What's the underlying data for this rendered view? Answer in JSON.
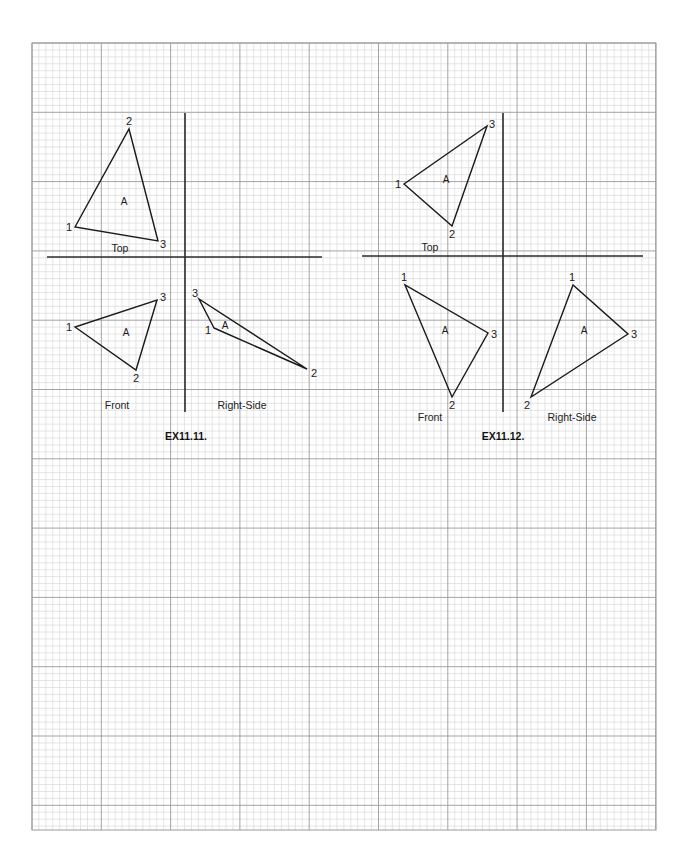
{
  "page": {
    "width": 691,
    "height": 868,
    "background": "#ffffff"
  },
  "grid": {
    "x0": 32,
    "y0": 43,
    "x1": 656,
    "y1": 830,
    "minor_step": 6.93,
    "major_every": 10,
    "minor_color": "#d4d4d4",
    "major_color": "#9a9a9a",
    "border_color": "#9a9a9a"
  },
  "colors": {
    "line": "#1a1a1a",
    "axis": "#2a2a2a",
    "text": "#1a1a1a"
  },
  "exercises": [
    {
      "id": "EX11.11.",
      "caption": {
        "text": "EX11.11.",
        "x": 186,
        "y": 436
      },
      "axes": {
        "horizontal": {
          "x1": 47,
          "y": 257,
          "x2": 322
        },
        "vertical": {
          "x": 185,
          "y1": 113,
          "y2": 412
        }
      },
      "views": [
        {
          "name": "Top",
          "label": {
            "text": "Top",
            "x": 120,
            "y": 248
          },
          "face_label": {
            "text": "A",
            "x": 124,
            "y": 202
          },
          "points": [
            {
              "n": "1",
              "x": 75,
              "y": 227,
              "lx": 69,
              "ly": 227
            },
            {
              "n": "2",
              "x": 129,
              "y": 129,
              "lx": 129,
              "ly": 121
            },
            {
              "n": "3",
              "x": 158,
              "y": 241,
              "lx": 163,
              "ly": 244
            }
          ]
        },
        {
          "name": "Front",
          "label": {
            "text": "Front",
            "x": 117,
            "y": 405
          },
          "face_label": {
            "text": "A",
            "x": 126,
            "y": 333
          },
          "points": [
            {
              "n": "1",
              "x": 75,
              "y": 327,
              "lx": 69,
              "ly": 327
            },
            {
              "n": "2",
              "x": 136,
              "y": 370,
              "lx": 136,
              "ly": 378
            },
            {
              "n": "3",
              "x": 157,
              "y": 300,
              "lx": 163,
              "ly": 297
            }
          ]
        },
        {
          "name": "Right-Side",
          "label": {
            "text": "Right-Side",
            "x": 242,
            "y": 405
          },
          "face_label": {
            "text": "A",
            "x": 225,
            "y": 326
          },
          "points": [
            {
              "n": "1",
              "x": 214,
              "y": 328,
              "lx": 208,
              "ly": 330
            },
            {
              "n": "2",
              "x": 307,
              "y": 369,
              "lx": 314,
              "ly": 373
            },
            {
              "n": "3",
              "x": 199,
              "y": 299,
              "lx": 195,
              "ly": 293
            }
          ]
        }
      ]
    },
    {
      "id": "EX11.12.",
      "caption": {
        "text": "EX11.12.",
        "x": 503,
        "y": 436
      },
      "axes": {
        "horizontal": {
          "x1": 362,
          "y": 256,
          "x2": 643
        },
        "vertical": {
          "x": 503,
          "y1": 113,
          "y2": 412
        }
      },
      "views": [
        {
          "name": "Top",
          "label": {
            "text": "Top",
            "x": 430,
            "y": 247
          },
          "face_label": {
            "text": "A",
            "x": 446,
            "y": 180
          },
          "points": [
            {
              "n": "1",
              "x": 404,
              "y": 184,
              "lx": 398,
              "ly": 184
            },
            {
              "n": "2",
              "x": 452,
              "y": 226,
              "lx": 452,
              "ly": 234
            },
            {
              "n": "3",
              "x": 487,
              "y": 126,
              "lx": 492,
              "ly": 124
            }
          ]
        },
        {
          "name": "Front",
          "label": {
            "text": "Front",
            "x": 430,
            "y": 417
          },
          "face_label": {
            "text": "A",
            "x": 445,
            "y": 331
          },
          "points": [
            {
              "n": "1",
              "x": 405,
              "y": 285,
              "lx": 404,
              "ly": 277
            },
            {
              "n": "2",
              "x": 452,
              "y": 397,
              "lx": 452,
              "ly": 405
            },
            {
              "n": "3",
              "x": 488,
              "y": 333,
              "lx": 494,
              "ly": 334
            }
          ]
        },
        {
          "name": "Right-Side",
          "label": {
            "text": "Right-Side",
            "x": 572,
            "y": 417
          },
          "face_label": {
            "text": "A",
            "x": 584,
            "y": 331
          },
          "points": [
            {
              "n": "1",
              "x": 573,
              "y": 285,
              "lx": 572,
              "ly": 277
            },
            {
              "n": "2",
              "x": 531,
              "y": 397,
              "lx": 527,
              "ly": 405
            },
            {
              "n": "3",
              "x": 628,
              "y": 334,
              "lx": 634,
              "ly": 334
            }
          ]
        }
      ]
    }
  ]
}
